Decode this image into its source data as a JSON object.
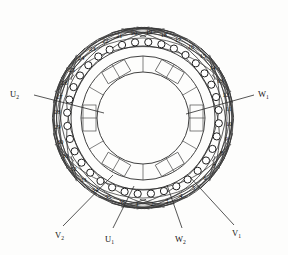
{
  "diagram": {
    "kind": "motor-winding-diagram",
    "slot_count": 36,
    "phase_count": 3,
    "background_color": "#fdfdfc",
    "line_color": "#3a3a3a",
    "slot_numbers": [
      "1",
      "2",
      "3",
      "4",
      "5",
      "6",
      "7",
      "8",
      "9",
      "10",
      "11",
      "12",
      "13",
      "14",
      "15",
      "16",
      "17",
      "18",
      "19",
      "20",
      "21",
      "22",
      "23",
      "24",
      "25",
      "26",
      "27",
      "28",
      "29",
      "30",
      "31",
      "32",
      "33",
      "34",
      "35",
      "36"
    ],
    "terminals": [
      {
        "id": "u2",
        "label": "U",
        "sub": "2",
        "position": "left"
      },
      {
        "id": "w1",
        "label": "W",
        "sub": "1",
        "position": "right"
      },
      {
        "id": "v2",
        "label": "V",
        "sub": "2",
        "position": "bottom-left"
      },
      {
        "id": "u1",
        "label": "U",
        "sub": "1",
        "position": "bottom-center-left"
      },
      {
        "id": "w2",
        "label": "W",
        "sub": "2",
        "position": "bottom-center-right"
      },
      {
        "id": "v1",
        "label": "V",
        "sub": "1",
        "position": "bottom-right"
      }
    ]
  }
}
